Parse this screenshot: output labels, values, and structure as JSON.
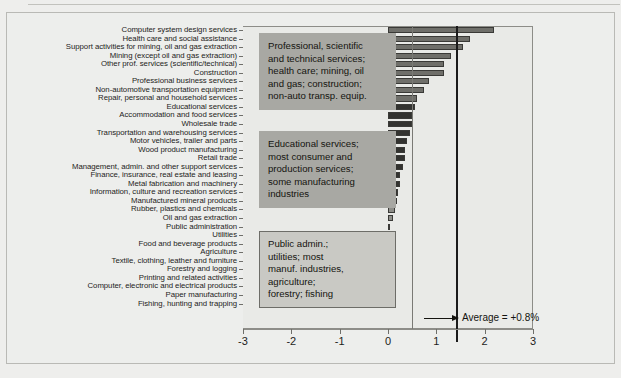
{
  "figure": {
    "background_color": "#edeeec",
    "plot_background_color": "#e9eae7"
  },
  "axis": {
    "ticks": [
      "-3",
      "-2",
      "-1",
      "0",
      "1",
      "2",
      "3"
    ],
    "tick_values": [
      -3,
      -2,
      -1,
      0,
      1,
      2,
      3
    ],
    "min": -3,
    "max": 3
  },
  "average": {
    "label": "Average = +0.8%",
    "value": 0.8
  },
  "annotations": [
    {
      "name": "group-1",
      "style": "dark",
      "lines": [
        "Professional, scientific",
        "and technical services;",
        "health care; mining, oil",
        "and gas; construction;",
        "non-auto transp. equip."
      ]
    },
    {
      "name": "group-2",
      "style": "dark",
      "lines": [
        "Educational services;",
        "most consumer and",
        "production services;",
        "some manufacturing",
        "industries"
      ]
    },
    {
      "name": "group-3",
      "style": "light",
      "lines": [
        "Public admin.;",
        "utilities; most",
        "manuf. industries,",
        "agriculture;",
        "forestry; fishing"
      ]
    }
  ],
  "chart_data": {
    "type": "bar",
    "orientation": "horizontal",
    "title": "",
    "xlabel": "",
    "ylabel": "",
    "xlim": [
      -3,
      3
    ],
    "grid": false,
    "legend": null,
    "average_line": 0.8,
    "categories": [
      "Computer system design services",
      "Health care and social assistance",
      "Support activities for mining, oil and gas extraction",
      "Mining (except oil and gas extraction)",
      "Other prof. services (scientific/technical)",
      "Construction",
      "Professional business services",
      "Non-automotive transportation equipment",
      "Repair, personal and household services",
      "Educational services",
      "Accommodation and food services",
      "Wholesale trade",
      "Transportation and warehousing services",
      "Motor vehicles, trailer and parts",
      "Wood product manufacturing",
      "Retail trade",
      "Management, admin. and other support services",
      "Finance, insurance, real estate and leasing",
      "Metal fabrication and machinery",
      "Information, culture and recreation services",
      "Manufactured mineral products",
      "Rubber, plastics and chemicals",
      "Oil and gas extraction",
      "Public administration",
      "Utilities",
      "Food and beverage products",
      "Agriculture",
      "Textile, clothing, leather and furniture",
      "Forestry and logging",
      "Printing and related activities",
      "Computer, electronic and electrical products",
      "Paper manufacturing",
      "Fishing, hunting and trapping"
    ],
    "values": [
      2.2,
      1.7,
      1.55,
      1.3,
      1.15,
      1.15,
      0.85,
      0.75,
      0.6,
      0.55,
      0.5,
      0.5,
      0.45,
      0.4,
      0.35,
      0.35,
      0.3,
      0.25,
      0.25,
      0.2,
      0.18,
      0.15,
      0.1,
      0.05,
      0.03,
      -0.3,
      -0.35,
      -0.4,
      -0.65,
      -0.8,
      -1.0,
      -1.15,
      -1.7
    ],
    "colors": [
      "#6f6f6a",
      "#6f6f6a",
      "#6f6f6a",
      "#6f6f6a",
      "#6f6f6a",
      "#6f6f6a",
      "#6f6f6a",
      "#6f6f6a",
      "#6f6f6a",
      "#333330",
      "#333330",
      "#333330",
      "#333330",
      "#333330",
      "#333330",
      "#333330",
      "#333330",
      "#333330",
      "#333330",
      "#333330",
      "#8e8e89",
      "#8e8e89",
      "#8e8e89",
      "#8e8e89",
      "#8e8e89",
      "#9a9a95",
      "#9a9a95",
      "#9a9a95",
      "#9a9a95",
      "#9a9a95",
      "#9a9a95",
      "#9a9a95",
      "#9a9a95"
    ]
  }
}
